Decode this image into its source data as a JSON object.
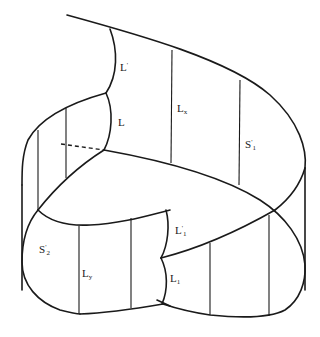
{
  "figure": {
    "stroke_color": "#1a1a1a",
    "background": "#ffffff"
  },
  "labels": {
    "L_prime": {
      "base": "L",
      "sup": "'",
      "sub": ""
    },
    "L": {
      "base": "L",
      "sup": "",
      "sub": ""
    },
    "Lx": {
      "base": "L",
      "sup": "",
      "sub": "x"
    },
    "S1_prime": {
      "base": "S",
      "sup": "'",
      "sub": "1"
    },
    "S2_prime": {
      "base": "S",
      "sup": "'",
      "sub": "2"
    },
    "Ly": {
      "base": "L",
      "sup": "",
      "sub": "y"
    },
    "L1_prime": {
      "base": "L",
      "sup": "'",
      "sub": "1"
    },
    "L1": {
      "base": "L",
      "sup": "",
      "sub": "1"
    }
  }
}
